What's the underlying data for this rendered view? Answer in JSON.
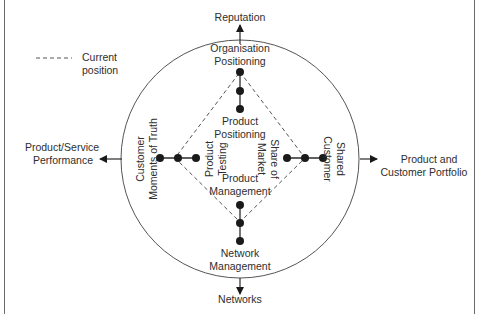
{
  "legend": {
    "line_style": "dashed",
    "label_line1": "Current",
    "label_line2": "position"
  },
  "outer_outcomes": {
    "top": "Reputation",
    "bottom": "Networks",
    "left_line1": "Product/Service",
    "left_line2": "Performance",
    "right_line1": "Product and",
    "right_line2": "Customer Portfolio"
  },
  "circle_labels": {
    "top_line1": "Organisation",
    "top_line2": "Positioning",
    "bottom_line1": "Network",
    "bottom_line2": "Management",
    "left_line1": "Customer",
    "left_line2": "Moments of Truth",
    "right_line1": "Shared",
    "right_line2": "Customer"
  },
  "inner_labels": {
    "top_line1": "Product",
    "top_line2": "Positioning",
    "bottom_line1": "Product",
    "bottom_line2": "Management",
    "left_line1": "Product",
    "left_line2": "Testing",
    "right_line1": "Share of",
    "right_line2": "Market"
  },
  "colors": {
    "line": "#3a3a3a",
    "dot": "#1a1a1a",
    "dashed": "#555555",
    "text": "#2e2e2e"
  }
}
